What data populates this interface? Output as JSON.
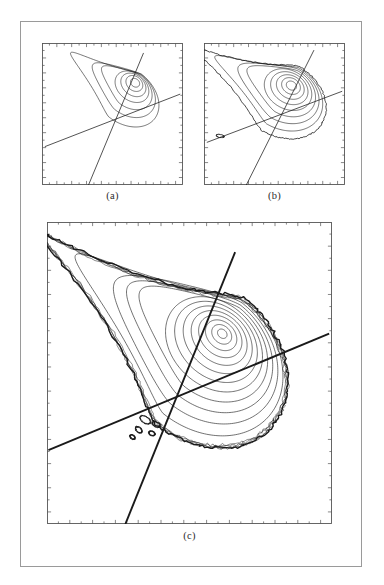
{
  "figure": {
    "page_background": "#ffffff",
    "frame_color": "#9a9a9a",
    "ink_color": "#1a1a1a",
    "panels": [
      {
        "id": "a",
        "caption": "(a)",
        "axis_color": "#555555",
        "n_contours": 7
      },
      {
        "id": "b",
        "caption": "(b)",
        "axis_color": "#555555",
        "n_contours": 9
      },
      {
        "id": "c",
        "caption": "(c)",
        "axis_color": "#555555",
        "n_contours": 13
      }
    ]
  },
  "chart_data": [
    {
      "type": "line",
      "panel": "a",
      "title": "(a)",
      "xlabel": "",
      "ylabel": "",
      "xlim": [
        0,
        1
      ],
      "ylim": [
        0,
        1
      ],
      "grid": false,
      "legend": "none",
      "description": "Contour plot: nested closed contour loops forming a teardrop / vortex roll-up centred upper-right, with two nearly straight separatrix lines crossing in the lower-left quadrant",
      "vortex_center": [
        0.66,
        0.72
      ],
      "contour_count": 7,
      "series": [
        {
          "name": "contour-ring-1",
          "kind": "closed-loop",
          "center": [
            0.66,
            0.72
          ],
          "rx": 0.035,
          "ry": 0.028,
          "rotation_deg": -38
        },
        {
          "name": "contour-ring-2",
          "kind": "closed-loop",
          "center": [
            0.655,
            0.715
          ],
          "rx": 0.065,
          "ry": 0.05,
          "rotation_deg": -38
        },
        {
          "name": "contour-ring-3",
          "kind": "closed-loop",
          "center": [
            0.648,
            0.705
          ],
          "rx": 0.098,
          "ry": 0.072,
          "rotation_deg": -38
        },
        {
          "name": "contour-ring-4",
          "kind": "closed-loop",
          "center": [
            0.638,
            0.692
          ],
          "rx": 0.132,
          "ry": 0.096,
          "rotation_deg": -38
        },
        {
          "name": "contour-ring-5",
          "kind": "teardrop",
          "center": [
            0.625,
            0.675
          ],
          "rx": 0.172,
          "ry": 0.125,
          "rotation_deg": -38
        },
        {
          "name": "contour-ring-6",
          "kind": "teardrop",
          "center": [
            0.61,
            0.655
          ],
          "rx": 0.215,
          "ry": 0.155,
          "rotation_deg": -38
        },
        {
          "name": "contour-ring-7",
          "kind": "teardrop-tail",
          "center": [
            0.59,
            0.63
          ],
          "rx": 0.265,
          "ry": 0.19,
          "rotation_deg": -38
        },
        {
          "name": "separatrix-shallow",
          "kind": "line",
          "x": [
            0.02,
            0.98
          ],
          "y": [
            0.27,
            0.64
          ]
        },
        {
          "name": "separatrix-steep",
          "kind": "line",
          "x": [
            0.33,
            0.72
          ],
          "y": [
            0.0,
            0.93
          ]
        }
      ],
      "axes": {
        "ticks_top": 19,
        "ticks_bottom": 19,
        "ticks_left": 19,
        "ticks_right": 19,
        "tick_labels": []
      }
    },
    {
      "type": "line",
      "panel": "b",
      "title": "(b)",
      "xlabel": "",
      "ylabel": "",
      "xlim": [
        0,
        1
      ],
      "ylim": [
        0,
        1
      ],
      "grid": false,
      "legend": "none",
      "description": "Contour plot: more developed vortex with 9 nested contours, a wider outer envelope and an irregular kinked outer contour extending to the left edge; two separatrix lines cross in the lower-left",
      "vortex_center": [
        0.62,
        0.7
      ],
      "contour_count": 9,
      "series": [
        {
          "name": "contour-ring-1",
          "kind": "closed-loop",
          "center": [
            0.62,
            0.7
          ],
          "rx": 0.038,
          "ry": 0.03,
          "rotation_deg": -30
        },
        {
          "name": "contour-ring-2",
          "kind": "closed-loop",
          "center": [
            0.617,
            0.697
          ],
          "rx": 0.07,
          "ry": 0.055,
          "rotation_deg": -30
        },
        {
          "name": "contour-ring-3",
          "kind": "closed-loop",
          "center": [
            0.612,
            0.69
          ],
          "rx": 0.104,
          "ry": 0.08,
          "rotation_deg": -30
        },
        {
          "name": "contour-ring-4",
          "kind": "closed-loop",
          "center": [
            0.605,
            0.682
          ],
          "rx": 0.14,
          "ry": 0.107,
          "rotation_deg": -30
        },
        {
          "name": "contour-ring-5",
          "kind": "closed-loop",
          "center": [
            0.596,
            0.672
          ],
          "rx": 0.178,
          "ry": 0.135,
          "rotation_deg": -30
        },
        {
          "name": "contour-ring-6",
          "kind": "teardrop",
          "center": [
            0.585,
            0.66
          ],
          "rx": 0.218,
          "ry": 0.165,
          "rotation_deg": -30
        },
        {
          "name": "contour-ring-7",
          "kind": "teardrop",
          "center": [
            0.572,
            0.645
          ],
          "rx": 0.258,
          "ry": 0.196,
          "rotation_deg": -30
        },
        {
          "name": "contour-ring-8",
          "kind": "teardrop-tail",
          "center": [
            0.558,
            0.628
          ],
          "rx": 0.3,
          "ry": 0.228,
          "rotation_deg": -30
        },
        {
          "name": "contour-ring-9-kinked",
          "kind": "irregular-envelope",
          "center": [
            0.54,
            0.61
          ],
          "rx": 0.345,
          "ry": 0.262,
          "rotation_deg": -30
        },
        {
          "name": "separatrix-shallow",
          "kind": "line",
          "x": [
            0.02,
            0.98
          ],
          "y": [
            0.3,
            0.66
          ]
        },
        {
          "name": "separatrix-steep",
          "kind": "line",
          "x": [
            0.3,
            0.78
          ],
          "y": [
            0.0,
            0.95
          ]
        }
      ],
      "axes": {
        "ticks_top": 19,
        "ticks_bottom": 19,
        "ticks_left": 19,
        "ticks_right": 19,
        "tick_labels": []
      }
    },
    {
      "type": "line",
      "panel": "c",
      "title": "(c)",
      "xlabel": "",
      "ylabel": "",
      "xlim": [
        0,
        1
      ],
      "ylim": [
        0,
        1
      ],
      "grid": false,
      "legend": "none",
      "description": "Fully rolled-up vortex: 13 nested smooth contours inside a thick, noisy, braided outer envelope with small secondary islands near the lower tip; two heavy separatrix lines cross near the lower-left of the roll-up",
      "vortex_center": [
        0.615,
        0.63
      ],
      "contour_count": 13,
      "series": [
        {
          "name": "contour-ring-1",
          "kind": "closed-loop",
          "center": [
            0.615,
            0.63
          ],
          "rx": 0.018,
          "ry": 0.014,
          "rotation_deg": -37
        },
        {
          "name": "contour-ring-2",
          "kind": "closed-loop",
          "center": [
            0.613,
            0.628
          ],
          "rx": 0.038,
          "ry": 0.029,
          "rotation_deg": -37
        },
        {
          "name": "contour-ring-3",
          "kind": "closed-loop",
          "center": [
            0.611,
            0.625
          ],
          "rx": 0.06,
          "ry": 0.045,
          "rotation_deg": -37
        },
        {
          "name": "contour-ring-4",
          "kind": "closed-loop",
          "center": [
            0.608,
            0.621
          ],
          "rx": 0.083,
          "ry": 0.062,
          "rotation_deg": -37
        },
        {
          "name": "contour-ring-5",
          "kind": "closed-loop",
          "center": [
            0.604,
            0.616
          ],
          "rx": 0.107,
          "ry": 0.08,
          "rotation_deg": -37
        },
        {
          "name": "contour-ring-6",
          "kind": "closed-loop",
          "center": [
            0.599,
            0.61
          ],
          "rx": 0.132,
          "ry": 0.099,
          "rotation_deg": -37
        },
        {
          "name": "contour-ring-7",
          "kind": "closed-loop",
          "center": [
            0.593,
            0.603
          ],
          "rx": 0.158,
          "ry": 0.119,
          "rotation_deg": -37
        },
        {
          "name": "contour-ring-8",
          "kind": "closed-loop",
          "center": [
            0.586,
            0.595
          ],
          "rx": 0.185,
          "ry": 0.14,
          "rotation_deg": -37
        },
        {
          "name": "contour-ring-9",
          "kind": "teardrop",
          "center": [
            0.578,
            0.586
          ],
          "rx": 0.213,
          "ry": 0.162,
          "rotation_deg": -37
        },
        {
          "name": "contour-ring-10",
          "kind": "teardrop",
          "center": [
            0.569,
            0.576
          ],
          "rx": 0.242,
          "ry": 0.185,
          "rotation_deg": -37
        },
        {
          "name": "contour-ring-11",
          "kind": "teardrop",
          "center": [
            0.559,
            0.565
          ],
          "rx": 0.272,
          "ry": 0.209,
          "rotation_deg": -37
        },
        {
          "name": "contour-ring-12",
          "kind": "teardrop-tail",
          "center": [
            0.548,
            0.553
          ],
          "rx": 0.303,
          "ry": 0.234,
          "rotation_deg": -37
        },
        {
          "name": "contour-ring-13-braided",
          "kind": "noisy-envelope",
          "center": [
            0.536,
            0.54
          ],
          "rx": 0.335,
          "ry": 0.26,
          "rotation_deg": -37
        },
        {
          "name": "separatrix-shallow",
          "kind": "line",
          "x": [
            0.005,
            0.99
          ],
          "y": [
            0.245,
            0.63
          ]
        },
        {
          "name": "separatrix-steep",
          "kind": "line",
          "x": [
            0.275,
            0.66
          ],
          "y": [
            0.0,
            0.9
          ]
        }
      ],
      "axes": {
        "ticks_top": 25,
        "ticks_bottom": 25,
        "ticks_left": 25,
        "ticks_right": 25,
        "tick_labels": []
      }
    }
  ]
}
